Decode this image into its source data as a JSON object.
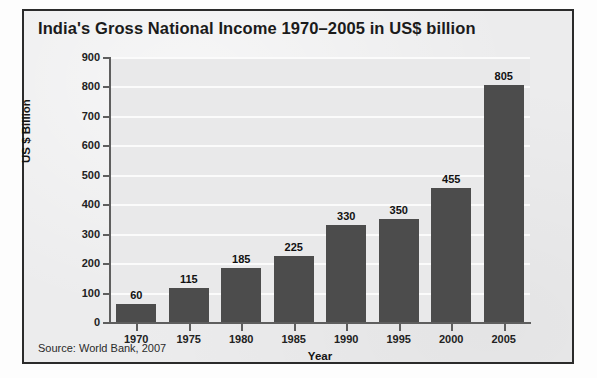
{
  "figure": {
    "title": "India's Gross National Income 1970–2005 in US$ billion",
    "source": "Source: World Bank, 2007",
    "bar_color": "#4c4c4c",
    "plot_background": "#e9e9ea",
    "gridline_color": "#fbfbfb",
    "frame_color": "#2b2b2b"
  },
  "chart_data": {
    "type": "bar",
    "title": "India's Gross National Income 1970–2005 in US$ billion",
    "categories": [
      "1970",
      "1975",
      "1980",
      "1985",
      "1990",
      "1995",
      "2000",
      "2005"
    ],
    "values": [
      60,
      115,
      185,
      225,
      330,
      350,
      455,
      805
    ],
    "xlabel": "Year",
    "ylabel": "US $ Billion",
    "ylim": [
      0,
      900
    ],
    "ytick_step": 100,
    "yticks": [
      "0",
      "100",
      "200",
      "300",
      "400",
      "500",
      "600",
      "700",
      "800",
      "900"
    ],
    "data_labels": [
      "60",
      "115",
      "185",
      "225",
      "330",
      "350",
      "455",
      "805"
    ],
    "grid": true,
    "legend": "none",
    "units": "US$ billion",
    "source": "Source: World Bank, 2007"
  }
}
